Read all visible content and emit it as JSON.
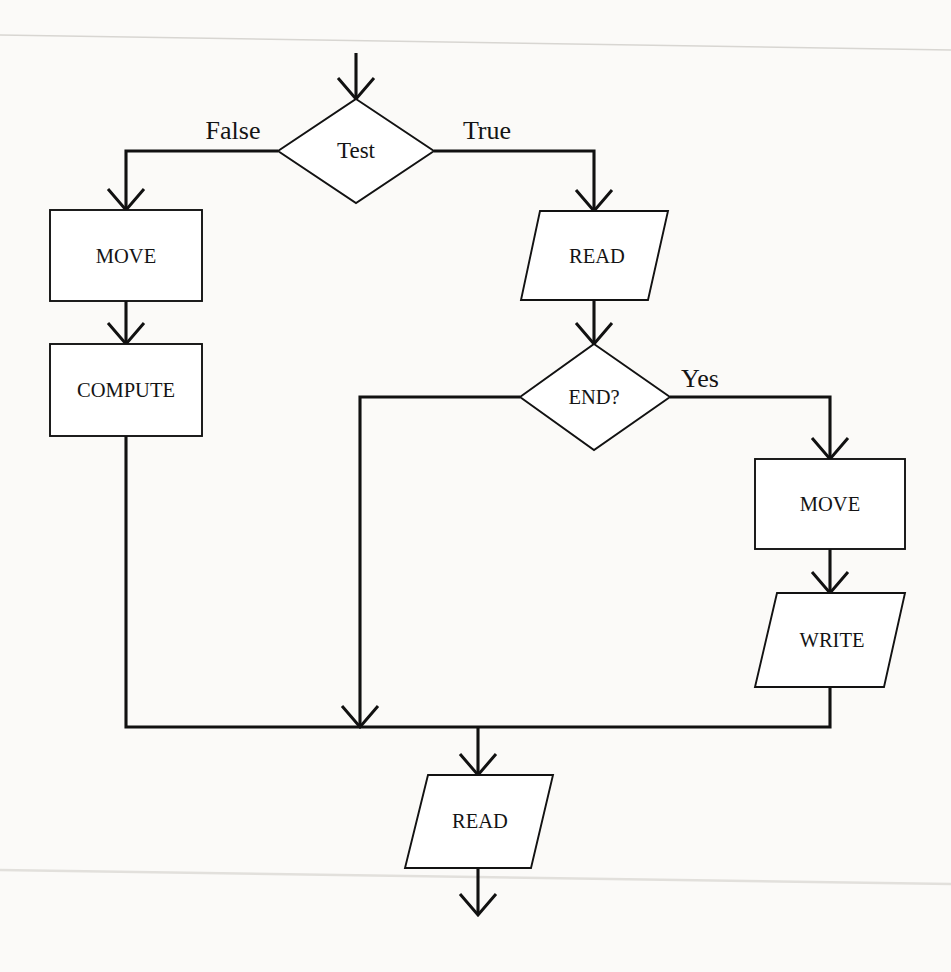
{
  "diagram": {
    "type": "flowchart",
    "background_color": "#fdfdfb",
    "line_color": "#111111",
    "text_color": "#141414",
    "nodes": [
      {
        "id": "test",
        "label": "Test",
        "shape": "decision",
        "cx": 356,
        "cy": 151
      },
      {
        "id": "move_left",
        "label": "MOVE",
        "shape": "process",
        "cx": 126,
        "cy": 256
      },
      {
        "id": "compute",
        "label": "COMPUTE",
        "shape": "process",
        "cx": 126,
        "cy": 390
      },
      {
        "id": "read_top",
        "label": "READ",
        "shape": "input-output",
        "cx": 594,
        "cy": 256
      },
      {
        "id": "end_check",
        "label": "END?",
        "shape": "decision",
        "cx": 594,
        "cy": 397
      },
      {
        "id": "move_right",
        "label": "MOVE",
        "shape": "process",
        "cx": 830,
        "cy": 504
      },
      {
        "id": "write",
        "label": "WRITE",
        "shape": "input-output",
        "cx": 830,
        "cy": 640
      },
      {
        "id": "read_bottom",
        "label": "READ",
        "shape": "input-output",
        "cx": 478,
        "cy": 821
      }
    ],
    "edge_labels": [
      {
        "id": "false-label",
        "text": "False",
        "x": 233,
        "y": 139
      },
      {
        "id": "true-label",
        "text": "True",
        "x": 487,
        "y": 139
      },
      {
        "id": "yes-label",
        "text": "Yes",
        "x": 700,
        "y": 387
      }
    ],
    "edges": [
      {
        "id": "entry-to-test",
        "from": "start",
        "to": "test",
        "label": ""
      },
      {
        "id": "test-false-to-move",
        "from": "test",
        "to": "move_left",
        "label": "False"
      },
      {
        "id": "test-true-to-read",
        "from": "test",
        "to": "read_top",
        "label": "True"
      },
      {
        "id": "move-to-compute",
        "from": "move_left",
        "to": "compute",
        "label": ""
      },
      {
        "id": "read-to-end",
        "from": "read_top",
        "to": "end_check",
        "label": ""
      },
      {
        "id": "end-no-to-merge",
        "from": "end_check",
        "to": "merge",
        "label": ""
      },
      {
        "id": "end-yes-to-move",
        "from": "end_check",
        "to": "move_right",
        "label": "Yes"
      },
      {
        "id": "move-to-write",
        "from": "move_right",
        "to": "write",
        "label": ""
      },
      {
        "id": "compute-to-merge",
        "from": "compute",
        "to": "merge",
        "label": ""
      },
      {
        "id": "write-to-merge",
        "from": "write",
        "to": "merge",
        "label": ""
      },
      {
        "id": "merge-to-read-bottom",
        "from": "merge",
        "to": "read_bottom",
        "label": ""
      },
      {
        "id": "read-bottom-to-exit",
        "from": "read_bottom",
        "to": "exit",
        "label": ""
      }
    ]
  }
}
